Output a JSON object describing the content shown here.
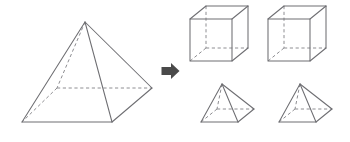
{
  "figure": {
    "background_color": "#ffffff",
    "line_color": "#6e6e72",
    "hidden_line_color": "#8e8e92",
    "arrow_color": "#4a4a4a"
  },
  "left_group": {
    "label": "large-square-pyramid",
    "shape_type": "square pyramid",
    "description": "Large square pyramid drawn in oblique projection with hidden back edges dashed",
    "vertices": {
      "apex": [
        85,
        22
      ],
      "base_front_left": [
        22,
        122
      ],
      "base_front_right": [
        112,
        122
      ],
      "base_right": [
        152,
        88
      ],
      "base_back_hidden": [
        57,
        88
      ]
    },
    "solid_edges": [
      "apex-base_front_left",
      "apex-base_front_right",
      "apex-base_right",
      "base_front_left-base_front_right",
      "base_front_right-base_right"
    ],
    "hidden_edges": [
      "apex-base_back_hidden",
      "base_back_hidden-base_front_left",
      "base_back_hidden-base_right"
    ]
  },
  "arrow": {
    "label": "right-arrow",
    "icon": "arrow-right-icon",
    "direction": "right",
    "position": [
      170,
      71
    ],
    "meaning": "decomposes into"
  },
  "right_group": {
    "label": "decomposed-solids",
    "items": [
      {
        "name": "cube-1",
        "shape_type": "cube",
        "front_face": {
          "x": 190,
          "y": 19,
          "w": 42,
          "h": 42
        },
        "depth_offset": [
          16,
          -13
        ],
        "hidden_vertex": "back-bottom-left"
      },
      {
        "name": "cube-2",
        "shape_type": "cube",
        "front_face": {
          "x": 268,
          "y": 19,
          "w": 42,
          "h": 42
        },
        "depth_offset": [
          16,
          -13
        ],
        "hidden_vertex": "back-bottom-left"
      },
      {
        "name": "pyramid-1",
        "shape_type": "square pyramid",
        "vertices": {
          "apex": [
            222,
            84
          ],
          "base_front_left": [
            201,
            122
          ],
          "base_front_right": [
            238,
            122
          ],
          "base_right": [
            254,
            109
          ],
          "base_back_hidden": [
            217,
            109
          ]
        }
      },
      {
        "name": "pyramid-2",
        "shape_type": "square pyramid",
        "vertices": {
          "apex": [
            300,
            84
          ],
          "base_front_left": [
            279,
            122
          ],
          "base_front_right": [
            316,
            122
          ],
          "base_right": [
            332,
            109
          ],
          "base_back_hidden": [
            295,
            109
          ]
        }
      }
    ],
    "counts": {
      "cubes": 2,
      "pyramids": 2
    }
  }
}
